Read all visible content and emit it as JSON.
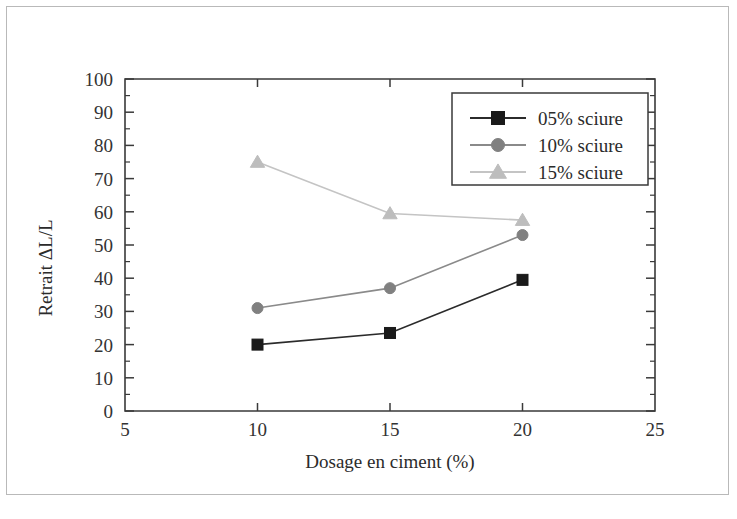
{
  "figure": {
    "background_color": "#ffffff",
    "border_color": "#b9b9b9"
  },
  "chart_data": {
    "type": "line",
    "title": "",
    "subtitle": "",
    "xlabel": "Dosage en ciment (%)",
    "ylabel": "Retrait ΔL/L",
    "x": [
      10,
      15,
      20
    ],
    "xlim": [
      5,
      25
    ],
    "ylim": [
      0,
      100
    ],
    "x_ticks": [
      5,
      10,
      15,
      20,
      25
    ],
    "x_tick_labels": [
      "5",
      "10",
      "15",
      "20",
      "25"
    ],
    "y_ticks": [
      0,
      10,
      20,
      30,
      40,
      50,
      60,
      70,
      80,
      90,
      100
    ],
    "y_tick_labels": [
      "0",
      "10",
      "20",
      "30",
      "40",
      "50",
      "60",
      "70",
      "80",
      "90",
      "100"
    ],
    "y_minor_ticks": [
      5,
      15,
      25,
      35,
      45,
      55,
      65,
      75,
      85,
      95
    ],
    "grid": false,
    "legend_position": "top-right",
    "series": [
      {
        "name": "05% sciure",
        "marker": "square",
        "color": "#1a1a1a",
        "line_color": "#2b2b2b",
        "values": [
          20,
          23.5,
          39.5
        ]
      },
      {
        "name": "10% sciure",
        "marker": "circle",
        "color": "#808080",
        "line_color": "#8a8a8a",
        "values": [
          31,
          37,
          53
        ]
      },
      {
        "name": "15% sciure",
        "marker": "triangle",
        "color": "#bdbdbd",
        "line_color": "#c4c4c4",
        "values": [
          75,
          59.5,
          57.5
        ]
      }
    ]
  },
  "legend": {
    "entries": [
      {
        "label": "05% sciure"
      },
      {
        "label": "10% sciure"
      },
      {
        "label": "15% sciure"
      }
    ]
  },
  "axes": {
    "x_title": "Dosage en ciment (%)",
    "y_title": "Retrait ΔL/L"
  }
}
